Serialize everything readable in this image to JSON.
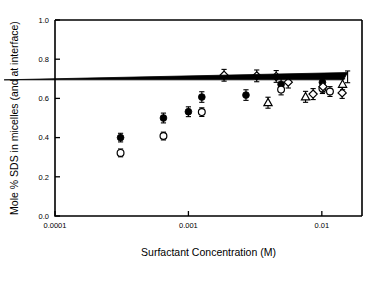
{
  "chart_data": {
    "type": "scatter",
    "title": "",
    "xlabel": "Surfactant Concentration (M)",
    "ylabel": "Mole % SDS in micelles (and at interface)",
    "xscale": "log",
    "xlim": [
      0.0001,
      0.02
    ],
    "ylim": [
      0.0,
      1.0
    ],
    "grid": false,
    "legend": "none",
    "xticklabels": [
      "0.0001",
      "0.001",
      "0.01"
    ],
    "xtickvalues": [
      0.0001,
      0.001,
      0.01
    ],
    "yticklabels": [
      "0.0",
      "0.2",
      "0.4",
      "0.6",
      "0.8",
      "1.0"
    ],
    "ytickvalues": [
      0.0,
      0.2,
      0.4,
      0.6,
      0.8,
      1.0
    ],
    "errorbars": true,
    "series": [
      {
        "name": "filled-circle",
        "marker": "filled-circle",
        "points": [
          {
            "x": 0.00031,
            "y": 0.4,
            "yerr": 0.022
          },
          {
            "x": 0.00065,
            "y": 0.5,
            "yerr": 0.025
          },
          {
            "x": 0.001,
            "y": 0.532,
            "yerr": 0.025
          },
          {
            "x": 0.00126,
            "y": 0.607,
            "yerr": 0.027
          },
          {
            "x": 0.0027,
            "y": 0.617,
            "yerr": 0.027
          },
          {
            "x": 0.00495,
            "y": 0.672,
            "yerr": 0.03
          },
          {
            "x": 0.0101,
            "y": 0.682,
            "yerr": 0.03
          }
        ]
      },
      {
        "name": "open-circle",
        "marker": "open-circle",
        "points": [
          {
            "x": 0.00031,
            "y": 0.322,
            "yerr": 0.02
          },
          {
            "x": 0.00065,
            "y": 0.408,
            "yerr": 0.02
          },
          {
            "x": 0.00126,
            "y": 0.53,
            "yerr": 0.022
          },
          {
            "x": 0.00495,
            "y": 0.645,
            "yerr": 0.027
          },
          {
            "x": 0.0101,
            "y": 0.65,
            "yerr": 0.025
          },
          {
            "x": 0.0115,
            "y": 0.635,
            "yerr": 0.025
          }
        ]
      },
      {
        "name": "open-diamond",
        "marker": "open-diamond",
        "points": [
          {
            "x": 0.00185,
            "y": 0.718,
            "yerr": 0.03
          },
          {
            "x": 0.00325,
            "y": 0.715,
            "yerr": 0.03
          },
          {
            "x": 0.00455,
            "y": 0.712,
            "yerr": 0.03
          },
          {
            "x": 0.0056,
            "y": 0.683,
            "yerr": 0.03
          },
          {
            "x": 0.0086,
            "y": 0.622,
            "yerr": 0.028
          },
          {
            "x": 0.0102,
            "y": 0.66,
            "yerr": 0.028
          },
          {
            "x": 0.0142,
            "y": 0.628,
            "yerr": 0.028
          }
        ]
      },
      {
        "name": "open-triangle",
        "marker": "open-triangle",
        "points": [
          {
            "x": 0.00395,
            "y": 0.578,
            "yerr": 0.028
          },
          {
            "x": 0.00755,
            "y": 0.608,
            "yerr": 0.028
          },
          {
            "x": 0.0143,
            "y": 0.672,
            "yerr": 0.028
          }
        ]
      },
      {
        "name": "filled-triangle",
        "marker": "filled-triangle",
        "points": [
          {
            "x": 0.0156,
            "y": 0.71,
            "yerr": 0.03
          }
        ]
      }
    ]
  }
}
